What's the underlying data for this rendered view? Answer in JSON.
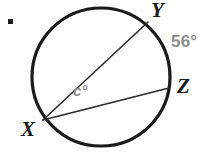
{
  "figure": {
    "kind": "circle-geometry-diagram",
    "background_color": "#ffffff",
    "stroke_color": "#1a1a1a",
    "label_color": "#1a1a1a",
    "measure_color": "#8d8d8d",
    "bullet": "list-bullet"
  },
  "circle": {
    "center_x": 101,
    "center_y": 77,
    "radius": 69,
    "stroke_width": 3.2
  },
  "points": {
    "X": {
      "x": 43,
      "y": 120,
      "label": "X"
    },
    "Y": {
      "x": 148,
      "y": 22,
      "label": "Y"
    },
    "Z": {
      "x": 169,
      "y": 88,
      "label": "Z"
    }
  },
  "chords": [
    {
      "name": "chord-XY",
      "from": "X",
      "to": "Y",
      "stroke_width": 1.6
    },
    {
      "name": "chord-XZ",
      "from": "X",
      "to": "Z",
      "stroke_width": 1.6
    }
  ],
  "labels": {
    "vertex_Y": "Y",
    "vertex_Z": "Z",
    "vertex_X": "X",
    "arc_measure": "56°",
    "angle_measure": "c°"
  },
  "chart_data": {
    "type": "diagram",
    "title": "",
    "annotations": [
      {
        "text": "Y",
        "x": 151,
        "y": 10,
        "color": "#1a1a1a"
      },
      {
        "text": "Z",
        "x": 177,
        "y": 86,
        "color": "#1a1a1a"
      },
      {
        "text": "X",
        "x": 21,
        "y": 129,
        "color": "#1a1a1a"
      },
      {
        "text": "56°",
        "x": 171,
        "y": 43,
        "color": "#8d8d8d"
      },
      {
        "text": "c°",
        "x": 73,
        "y": 91,
        "color": "#8d8d8d"
      }
    ]
  }
}
